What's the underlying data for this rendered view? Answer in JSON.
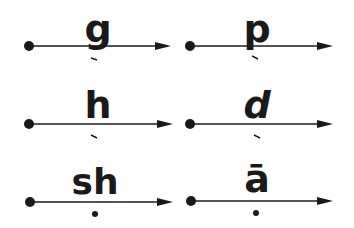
{
  "cards": [
    {
      "letter": "g",
      "mark": "stroke",
      "line_y": 46
    },
    {
      "letter": "p",
      "mark": "stroke",
      "line_y": 46
    },
    {
      "letter": "h",
      "mark": "stroke",
      "line_y": 124
    },
    {
      "letter": "d",
      "mark": "stroke",
      "line_y": 124
    },
    {
      "letter": "sh",
      "mark": "dot",
      "line_y": 202
    },
    {
      "letter": "ā",
      "mark": "dot",
      "line_y": 202
    }
  ],
  "colors": {
    "ink": "#1a1a1a",
    "background": "#ffffff"
  }
}
